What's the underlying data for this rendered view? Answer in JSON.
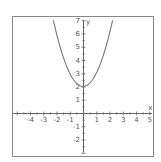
{
  "chart_data": {
    "type": "line",
    "title": "",
    "function": "y = x^2 + 2",
    "xlabel": "x",
    "ylabel": "y",
    "xlim": [
      -5.3,
      5.3
    ],
    "ylim": [
      -3,
      7
    ],
    "x_ticks": [
      -4,
      -3,
      -2,
      -1,
      1,
      2,
      3,
      4,
      5
    ],
    "y_ticks": [
      7,
      6,
      5,
      4,
      3,
      2,
      1,
      -1,
      -2
    ],
    "grid": false,
    "legend": null,
    "series": [
      {
        "name": "y = x^2 + 2",
        "x": [
          -2.24,
          -2,
          -1.5,
          -1,
          -0.5,
          0,
          0.5,
          1,
          1.5,
          2,
          2.24
        ],
        "values": [
          7.0,
          6,
          4.25,
          3,
          2.25,
          2,
          2.25,
          3,
          4.25,
          6,
          7.0
        ]
      }
    ],
    "vertex": [
      0,
      2
    ]
  },
  "colors": {
    "frame": "#888888",
    "axis": "#666666",
    "curve": "#777777",
    "text": "#555555"
  },
  "layout": {
    "origin_px": [
      83,
      113
    ],
    "px_per_unit": 13.25,
    "frame": [
      12,
      16,
      154,
      157
    ]
  }
}
